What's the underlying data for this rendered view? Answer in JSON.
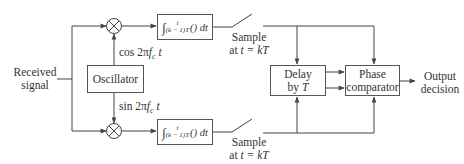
{
  "diagram": {
    "title": "",
    "input_label_line1": "Received",
    "input_label_line2": "signal",
    "oscillator_label": "Oscillator",
    "cos_label_prefix": "cos 2π",
    "cos_label_f": "f",
    "cos_label_sub": "c",
    "cos_label_t": " t",
    "sin_label_prefix": "sin 2π",
    "sin_label_f": "f",
    "sin_label_sub": "c",
    "sin_label_t": " t",
    "integrator_top": {
      "upper_limit": "t",
      "lower_limit": "(k − 1)T",
      "body": "() dt"
    },
    "integrator_bottom": {
      "upper_limit": "t",
      "lower_limit": "(k − 1)T",
      "body": "() dt"
    },
    "sampler_top_line1": "Sample",
    "sampler_top_line2_prefix": "at ",
    "sampler_top_line2_expr": "t = kT",
    "sampler_bottom_line1": "Sample",
    "sampler_bottom_line2_prefix": "at ",
    "sampler_bottom_line2_expr": "t = kT",
    "delay_line1": "Delay",
    "delay_line2_prefix": "by ",
    "delay_line2_var": "T",
    "comparator_line1": "Phase",
    "comparator_line2": "comparator",
    "output_line1": "Output",
    "output_line2": "decision",
    "multiplier_symbol": "×",
    "colors": {
      "line": "#444444",
      "text": "#333333",
      "background": "#ffffff"
    }
  }
}
